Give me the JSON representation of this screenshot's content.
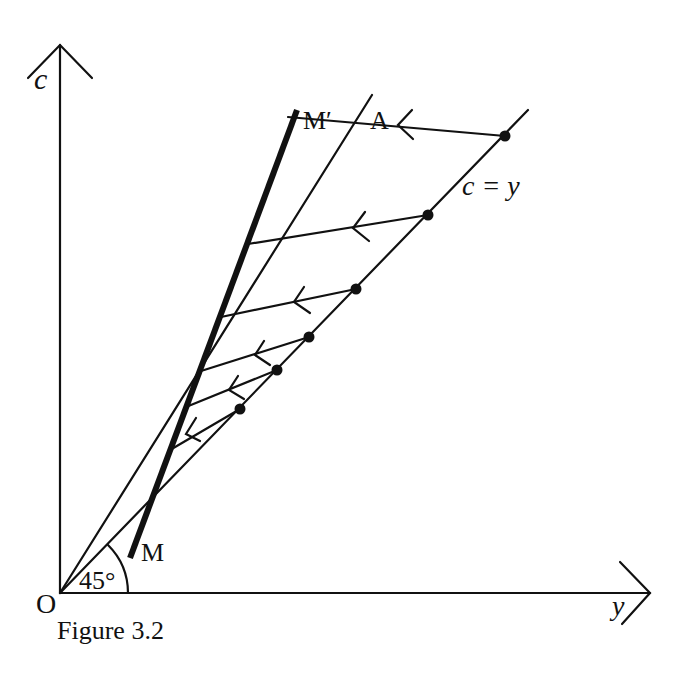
{
  "figure": {
    "caption": "Figure 3.2",
    "axes": {
      "vertical_label": "c",
      "horizontal_label": "y",
      "origin_label": "O"
    },
    "angle_label": "45°",
    "lines": {
      "identity_label": "c = y",
      "line_a_label": "A",
      "line_m_bottom_label": "M",
      "line_m_top_label": "M′"
    },
    "colors": {
      "ink": "#111111",
      "background": "#ffffff"
    },
    "geometry": {
      "origin": [
        60,
        593
      ],
      "vertical_axis_top": [
        60,
        45
      ],
      "horizontal_axis_end": [
        650,
        593
      ],
      "identity_line_end": [
        528,
        110
      ],
      "line_a_end": [
        372,
        95
      ],
      "line_m_start": [
        130,
        558
      ],
      "line_m_end": [
        297,
        110
      ],
      "adjustment_paths": [
        {
          "from": [
            505,
            136
          ],
          "to": [
            288,
            117
          ]
        },
        {
          "from": [
            428,
            215
          ],
          "to": [
            248,
            244
          ]
        },
        {
          "from": [
            356,
            289
          ],
          "to": [
            221,
            317
          ]
        },
        {
          "from": [
            309,
            337
          ],
          "to": [
            201,
            371
          ]
        },
        {
          "from": [
            277,
            370
          ],
          "to": [
            186,
            407
          ]
        },
        {
          "from": [
            240,
            409
          ],
          "to": [
            170,
            450
          ]
        }
      ]
    }
  }
}
